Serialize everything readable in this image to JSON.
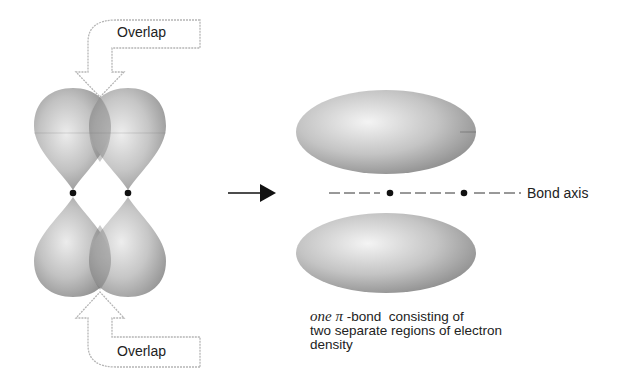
{
  "figure": {
    "left_panel": {
      "description": "two side-by-side p orbitals overlapping sideways",
      "top_callout_label": "Overlap",
      "bottom_callout_label": "Overlap"
    },
    "transition_arrow": "right-arrow",
    "right_panel": {
      "description": "pi bond electron density above and below bond axis",
      "axis_label": "Bond axis"
    },
    "caption": {
      "italic_prefix": "one",
      "symbol": "π",
      "line1_rest": "-bond  consisting of",
      "line2": "two separate regions of electron",
      "line3": "density"
    },
    "colors": {
      "lobe_light": "#e8e8e8",
      "lobe_dark": "#8c8c8c",
      "callout_border": "#b5b5b5",
      "nucleus": "#111111"
    }
  }
}
